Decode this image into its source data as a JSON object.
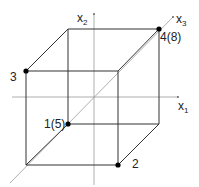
{
  "diagram": {
    "type": "3d-cube-coordinate-system",
    "axes": [
      {
        "id": "x1",
        "label": "x",
        "subscript": "1"
      },
      {
        "id": "x2",
        "label": "x",
        "subscript": "2"
      },
      {
        "id": "x3",
        "label": "x",
        "subscript": "3"
      }
    ],
    "vertices": [
      {
        "id": "v1",
        "label": "1(5)",
        "marked": true
      },
      {
        "id": "v2",
        "label": "2",
        "marked": true
      },
      {
        "id": "v3",
        "label": "3",
        "marked": true
      },
      {
        "id": "v4",
        "label": "4(8)",
        "marked": true
      }
    ],
    "colors": {
      "edge": "#333333",
      "axis": "#9a9a9a",
      "point": "#000000",
      "text": "#222222"
    }
  }
}
